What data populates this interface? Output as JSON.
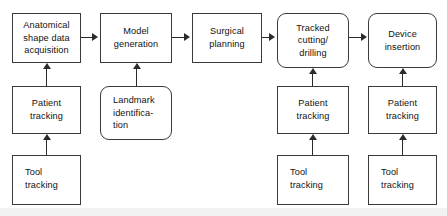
{
  "diagram": {
    "type": "flowchart",
    "background_color": "#ffffff",
    "stroke_color": "#3a3a3a",
    "arrow_color": "#2b2b2b",
    "nodes": [
      {
        "id": "anatomical",
        "label": "Anatomical\nshape data\nacquisition",
        "shape": "rect",
        "x": 12,
        "y": 13,
        "w": 69,
        "h": 50
      },
      {
        "id": "model",
        "label": "Model\ngeneration",
        "shape": "rect",
        "x": 100,
        "y": 13,
        "w": 72,
        "h": 50
      },
      {
        "id": "surgical",
        "label": "Surgical\nplanning",
        "shape": "rect",
        "x": 192,
        "y": 13,
        "w": 70,
        "h": 50
      },
      {
        "id": "tracked",
        "label": "Tracked\ncutting/\ndrilling",
        "shape": "rounded-rect",
        "x": 277,
        "y": 13,
        "w": 72,
        "h": 55
      },
      {
        "id": "device",
        "label": "Device\ninsertion",
        "shape": "rounded-rect",
        "x": 368,
        "y": 13,
        "w": 69,
        "h": 55
      },
      {
        "id": "patient1",
        "label": "Patient\ntracking",
        "shape": "rect",
        "x": 12,
        "y": 86,
        "w": 69,
        "h": 48
      },
      {
        "id": "landmark",
        "label": "Landmark\nidentifica-\ntion",
        "shape": "rounded-rect",
        "x": 100,
        "y": 86,
        "w": 72,
        "h": 54
      },
      {
        "id": "patient2",
        "label": "Patient\ntracking",
        "shape": "rect",
        "x": 277,
        "y": 86,
        "w": 72,
        "h": 48
      },
      {
        "id": "patient3",
        "label": "Patient\ntracking",
        "shape": "rect",
        "x": 368,
        "y": 86,
        "w": 69,
        "h": 48
      },
      {
        "id": "tool1",
        "label": "Tool\ntracking",
        "shape": "rect",
        "x": 12,
        "y": 155,
        "w": 69,
        "h": 50
      },
      {
        "id": "tool2",
        "label": "Tool\ntracking",
        "shape": "rect",
        "x": 277,
        "y": 155,
        "w": 72,
        "h": 50
      },
      {
        "id": "tool3",
        "label": "Tool\ntracking",
        "shape": "rect",
        "x": 368,
        "y": 155,
        "w": 69,
        "h": 50
      }
    ],
    "edges": [
      {
        "id": "e1",
        "from": "anatomical",
        "to": "model",
        "direction": "right"
      },
      {
        "id": "e2",
        "from": "model",
        "to": "surgical",
        "direction": "right"
      },
      {
        "id": "e3",
        "from": "surgical",
        "to": "tracked",
        "direction": "right"
      },
      {
        "id": "e4",
        "from": "tracked",
        "to": "device",
        "direction": "right"
      },
      {
        "id": "e5",
        "from": "patient1",
        "to": "anatomical",
        "direction": "up"
      },
      {
        "id": "e6",
        "from": "landmark",
        "to": "model",
        "direction": "up"
      },
      {
        "id": "e7",
        "from": "tool1",
        "to": "patient1",
        "direction": "up"
      },
      {
        "id": "e8",
        "from": "patient2",
        "to": "tracked",
        "direction": "up"
      },
      {
        "id": "e9",
        "from": "tool2",
        "to": "patient2",
        "direction": "up"
      },
      {
        "id": "e10",
        "from": "patient3",
        "to": "device",
        "direction": "up"
      },
      {
        "id": "e11",
        "from": "tool3",
        "to": "patient3",
        "direction": "up"
      }
    ]
  }
}
